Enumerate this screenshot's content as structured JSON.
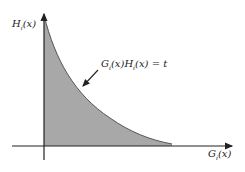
{
  "diagram": {
    "y_axis_label": "H_i(x)",
    "x_axis_label": "G_i(x)",
    "curve_label": "G_i(x)H_i(x) = t",
    "fill_color": "#a8a8a8",
    "axis_color": "#222222"
  },
  "labels": {
    "y_axis_main": "H",
    "y_axis_sub": "i",
    "y_axis_arg": "(x)",
    "x_axis_main": "G",
    "x_axis_sub": "i",
    "x_axis_arg": "(x)",
    "curve_g": "G",
    "curve_g_sub": "i",
    "curve_g_arg": "(x)",
    "curve_h": "H",
    "curve_h_sub": "i",
    "curve_h_arg": "(x)",
    "curve_eq": " = t"
  }
}
